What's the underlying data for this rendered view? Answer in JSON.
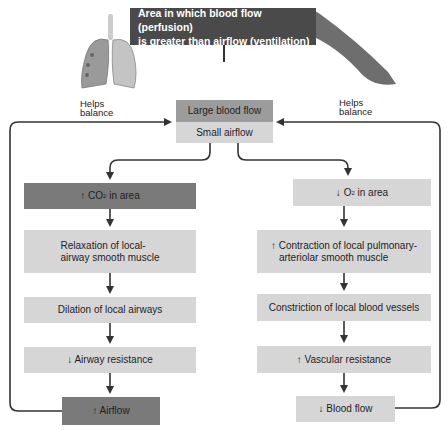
{
  "top": {
    "title_line1": "Area in which blood flow (perfusion)",
    "title_line2": "is greater than airflow (ventilation)"
  },
  "images": {
    "lungs": "lungs-illustration",
    "vessel": "blood-vessel-illustration"
  },
  "helps_balance_left": {
    "line1": "Helps",
    "line2": "balance"
  },
  "helps_balance_right": {
    "line1": "Helps",
    "line2": "balance"
  },
  "center": {
    "large_blood_flow": "Large blood flow",
    "small_airflow": "Small airflow"
  },
  "left_column": {
    "co2_arrow": "↑",
    "co2_prefix": "CO",
    "co2_sub": "2",
    "co2_suffix": " in area",
    "relaxation_line1": "Relaxation of local-",
    "relaxation_line2": "airway smooth muscle",
    "dilation": "Dilation of local airways",
    "airway_resistance": "↓ Airway resistance",
    "airflow": "↑ Airflow"
  },
  "right_column": {
    "o2_arrow": "↓",
    "o2_prefix": "O",
    "o2_sub": "2",
    "o2_suffix": " in area",
    "contraction_line1": "↑ Contraction of local pulmonary-",
    "contraction_line2": "arteriolar smooth muscle",
    "constriction": "Constriction of local blood vessels",
    "vascular_resistance": "↑ Vascular resistance",
    "blood_flow": "↓ Blood flow"
  },
  "colors": {
    "top_box": "#4a4a4a",
    "dark_box": "#7a7a7a",
    "mid_box": "#9c9c9c",
    "light_box": "#d6d6d6",
    "arrow": "#333333"
  }
}
